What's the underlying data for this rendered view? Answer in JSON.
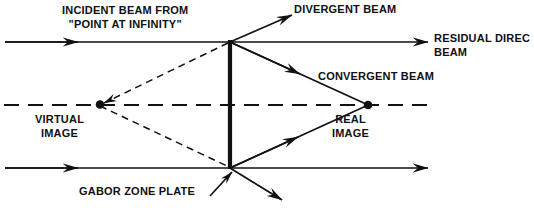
{
  "diagram": {
    "background_color": "#ffffff",
    "line_color": "#111111",
    "labels": {
      "incident_beam_line1": "INCIDENT BEAM FROM",
      "incident_beam_line2": "\"POINT AT INFINITY\"",
      "divergent_beam": "DIVERGENT BEAM",
      "residual_direct_line1": "RESIDUAL DIREC",
      "residual_direct_line2": "BEAM",
      "convergent_beam": "CONVERGENT BEAM",
      "virtual_image_line1": "VIRTUAL",
      "virtual_image_line2": "IMAGE",
      "real_image_line1": "REAL",
      "real_image_line2": "IMAGE",
      "gabor_zone_plate": "GABOR ZONE PLATE"
    },
    "geometry": {
      "zone_plate_x": 230,
      "zone_plate_top_y": 40,
      "zone_plate_bottom_y": 168,
      "top_vertex": [
        230,
        42
      ],
      "bottom_vertex": [
        230,
        168
      ],
      "virtual_image_point": [
        100,
        104
      ],
      "real_image_point": [
        368,
        105
      ],
      "optical_axis_y": 105
    }
  }
}
